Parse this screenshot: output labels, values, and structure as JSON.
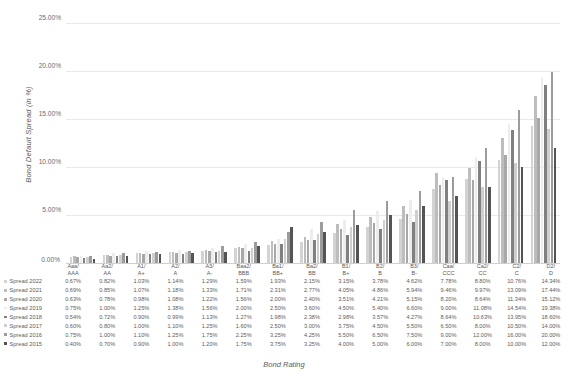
{
  "chart_data": {
    "type": "bar",
    "title": "",
    "xlabel": "Bond Rating",
    "ylabel": "Bond Default Spread (in %)",
    "ylim": [
      0,
      25
    ],
    "ytick_labels": [
      "0.00%",
      "5.00%",
      "10.00%",
      "15.00%",
      "20.00%",
      "25.00%"
    ],
    "ytick_values": [
      0,
      5,
      10,
      15,
      20,
      25
    ],
    "grid": true,
    "legend_position": "bottom-table",
    "categories": [
      "Aaa/ AAA",
      "Aa2/ AA",
      "A1/ A+",
      "A2/ A",
      "A3/ A-",
      "Baa2/ BBB",
      "Ba1/ BB+",
      "Ba2/ BB",
      "B1/ B+",
      "B2/ B",
      "B3/ B-",
      "Caa/ CCC",
      "Ca2/ CC",
      "C2/ C",
      "D2/ D"
    ],
    "series": [
      {
        "name": "Spread 2022",
        "color": "#d3d3d3",
        "values": [
          0.67,
          0.82,
          1.03,
          1.14,
          1.29,
          1.59,
          1.93,
          2.15,
          3.15,
          3.78,
          4.62,
          7.78,
          8.8,
          10.76,
          14.34
        ],
        "labels": [
          "0.67%",
          "0.82%",
          "1.03%",
          "1.14%",
          "1.29%",
          "1.59%",
          "1.93%",
          "2.15%",
          "3.15%",
          "3.78%",
          "4.62%",
          "7.78%",
          "8.80%",
          "10.76%",
          "14.34%"
        ]
      },
      {
        "name": "Spread 2021",
        "color": "#bdbdbd",
        "values": [
          0.69,
          0.85,
          1.07,
          1.18,
          1.33,
          1.71,
          2.31,
          2.77,
          4.05,
          4.86,
          5.94,
          9.46,
          9.97,
          13.09,
          17.44
        ],
        "labels": [
          "0.69%",
          "0.85%",
          "1.07%",
          "1.18%",
          "1.33%",
          "1.71%",
          "2.31%",
          "2.77%",
          "4.05%",
          "4.86%",
          "5.94%",
          "9.46%",
          "9.97%",
          "13.09%",
          "17.44%"
        ]
      },
      {
        "name": "Spread 2020",
        "color": "#a8a8a8",
        "values": [
          0.63,
          0.78,
          0.98,
          1.08,
          1.22,
          1.56,
          2.0,
          2.4,
          3.51,
          4.21,
          5.15,
          8.2,
          8.64,
          11.34,
          15.12
        ],
        "labels": [
          "0.63%",
          "0.78%",
          "0.98%",
          "1.08%",
          "1.22%",
          "1.56%",
          "2.00%",
          "2.40%",
          "3.51%",
          "4.21%",
          "5.15%",
          "8.20%",
          "8.64%",
          "11.34%",
          "15.12%"
        ]
      },
      {
        "name": "Spread 2019",
        "color": "#ededed",
        "values": [
          0.75,
          1.0,
          1.25,
          1.38,
          1.56,
          2.0,
          2.5,
          3.6,
          4.5,
          5.4,
          6.6,
          9.0,
          11.08,
          14.54,
          19.38
        ],
        "labels": [
          "0.75%",
          "1.00%",
          "1.25%",
          "1.38%",
          "1.56%",
          "2.00%",
          "2.50%",
          "3.60%",
          "4.50%",
          "5.40%",
          "6.60%",
          "9.00%",
          "11.08%",
          "14.54%",
          "19.38%"
        ]
      },
      {
        "name": "Spread 2018",
        "color": "#808080",
        "values": [
          0.54,
          0.72,
          0.9,
          0.99,
          1.13,
          1.27,
          1.98,
          2.38,
          2.98,
          3.57,
          4.27,
          8.64,
          10.63,
          13.95,
          18.6
        ],
        "labels": [
          "0.54%",
          "0.72%",
          "0.90%",
          "0.99%",
          "1.13%",
          "1.27%",
          "1.98%",
          "2.38%",
          "2.98%",
          "3.57%",
          "4.27%",
          "8.64%",
          "10.63%",
          "13.95%",
          "18.60%"
        ]
      },
      {
        "name": "Spread 2017",
        "color": "#cfcfcf",
        "values": [
          0.6,
          0.8,
          1.0,
          1.1,
          1.25,
          1.6,
          2.5,
          3.0,
          3.75,
          4.5,
          5.5,
          6.5,
          8.0,
          10.5,
          14.0
        ],
        "labels": [
          "0.60%",
          "0.80%",
          "1.00%",
          "1.10%",
          "1.25%",
          "1.60%",
          "2.50%",
          "3.00%",
          "3.75%",
          "4.50%",
          "5.50%",
          "6.50%",
          "8.00%",
          "10.50%",
          "14.00%"
        ]
      },
      {
        "name": "Spread 2016",
        "color": "#9c9c9c",
        "values": [
          0.75,
          1.0,
          1.1,
          1.25,
          1.75,
          2.25,
          3.25,
          4.25,
          5.5,
          6.5,
          7.5,
          9.0,
          12.0,
          16.0,
          20.0
        ],
        "labels": [
          "0.75%",
          "1.00%",
          "1.10%",
          "1.25%",
          "1.75%",
          "2.25%",
          "3.25%",
          "4.25%",
          "5.50%",
          "6.50%",
          "7.50%",
          "9.00%",
          "12.00%",
          "16.00%",
          "20.00%"
        ]
      },
      {
        "name": "Spread 2015",
        "color": "#545454",
        "values": [
          0.4,
          0.7,
          0.9,
          1.0,
          1.2,
          1.75,
          3.75,
          3.25,
          4.0,
          5.0,
          6.0,
          7.0,
          8.0,
          10.0,
          12.0
        ],
        "labels": [
          "0.40%",
          "0.70%",
          "0.90%",
          "1.00%",
          "1.20%",
          "1.75%",
          "3.75%",
          "3.25%",
          "4.00%",
          "5.00%",
          "6.00%",
          "7.00%",
          "8.00%",
          "10.00%",
          "12.00%"
        ]
      }
    ]
  }
}
